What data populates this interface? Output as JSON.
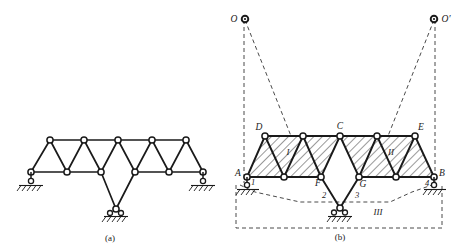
{
  "figure": {
    "panels": [
      {
        "id": "a",
        "caption": "(a)",
        "description": "Warren truss with three supports"
      },
      {
        "id": "b",
        "caption": "(b)",
        "description": "Rigid body decomposition with instantaneous centers O and O-prime"
      }
    ]
  },
  "colors": {
    "ink": "#1a1a1a",
    "hatch": "#3a3a3a",
    "dash": "#4a4a4a",
    "node_fill": "#ffffff",
    "background": "#ffffff"
  },
  "panel_a": {
    "caption": "(a)",
    "top_chord_nodes": 5,
    "bottom_chord_nodes": 6,
    "supports": [
      {
        "name": "left-pin-support",
        "type": "pin-hatched"
      },
      {
        "name": "right-pin-support",
        "type": "pin-hatched"
      },
      {
        "name": "bottom-pin-support",
        "type": "pin-hatched"
      }
    ]
  },
  "panel_b": {
    "caption": "(b)",
    "labels": {
      "O": "O",
      "O_prime": "O′",
      "A": "A",
      "B": "B",
      "C": "C",
      "D": "D",
      "E": "E",
      "F": "F",
      "G": "G",
      "one": "1",
      "two": "2",
      "three": "3",
      "four": "4",
      "region_I": "I",
      "region_II": "II",
      "region_III": "III"
    },
    "rigid_bodies": [
      {
        "id": "I",
        "label": "I",
        "note": "left hatched truss panel A-D-C-F"
      },
      {
        "id": "II",
        "label": "II",
        "note": "right hatched truss panel G-C-E-B"
      },
      {
        "id": "III",
        "label": "III",
        "note": "ground / foundation body"
      }
    ],
    "links": [
      {
        "id": "1",
        "label": "1",
        "note": "support link at A"
      },
      {
        "id": "2",
        "label": "2",
        "note": "link from F to bottom support"
      },
      {
        "id": "3",
        "label": "3",
        "note": "link from G to bottom support"
      },
      {
        "id": "4",
        "label": "4",
        "note": "support link at B"
      }
    ],
    "instant_centers": [
      {
        "id": "O",
        "label": "O",
        "note": "instantaneous center for body I relative to III"
      },
      {
        "id": "O'",
        "label": "O′",
        "note": "instantaneous center for body II relative to III"
      }
    ],
    "supports": [
      {
        "name": "support-A",
        "type": "roller-pin-hatched"
      },
      {
        "name": "support-B",
        "type": "roller-pin-hatched"
      },
      {
        "name": "support-bottom",
        "type": "pin-hatched"
      }
    ]
  }
}
